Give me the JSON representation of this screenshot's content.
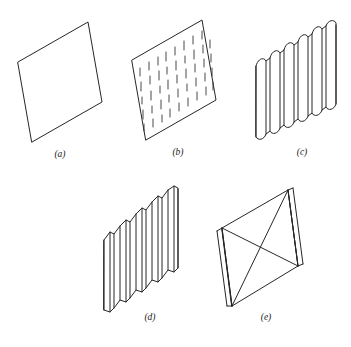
{
  "figure": {
    "type": "line-diagram",
    "background_color": "#ffffff",
    "stroke_color": "#262626",
    "stroke_width": 1.0,
    "panels": [
      {
        "id": "a",
        "caption": "(a)",
        "name": "plain-flat-panel",
        "description": "Plain flat rectangular panel drawn as a parallelogram in isometric projection",
        "features": {
          "corrugations": 0,
          "dashes": false,
          "diagonal_bracing": false,
          "edge_stiffeners": false
        }
      },
      {
        "id": "b",
        "caption": "(b)",
        "name": "dashed-fill-panel",
        "description": "Flat panel covered with irregular short vertical dashes in staggered columns",
        "features": {
          "corrugations": 0,
          "dashes": true,
          "dash_columns": 9,
          "diagonal_bracing": false,
          "edge_stiffeners": false
        }
      },
      {
        "id": "c",
        "caption": "(c)",
        "name": "wide-corrugated-panel",
        "description": "Corrugated panel with wide rounded flutes and scalloped top and bottom edges",
        "features": {
          "corrugations": 7,
          "profile": "wide-rounded",
          "dashes": false,
          "diagonal_bracing": false,
          "edge_stiffeners": false
        }
      },
      {
        "id": "d",
        "caption": "(d)",
        "name": "narrow-corrugated-panel",
        "description": "Corrugated panel with narrow deep sharp-angled folds",
        "features": {
          "corrugations": 6,
          "profile": "narrow-angular",
          "dashes": false,
          "diagonal_bracing": false,
          "edge_stiffeners": false
        }
      },
      {
        "id": "e",
        "caption": "(e)",
        "name": "x-braced-panel",
        "description": "Panel with crossed diagonal bracing and thickened vertical edge stiffeners on both sides",
        "features": {
          "corrugations": 0,
          "dashes": false,
          "diagonal_bracing": true,
          "diagonal_count": 4,
          "edge_stiffeners": true
        }
      }
    ]
  }
}
